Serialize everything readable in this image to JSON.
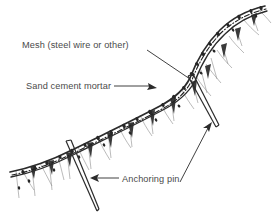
{
  "figure": {
    "background_color": "#ffffff",
    "line_color": "#2b2b2b",
    "hatch_color": "#8d8d8d",
    "text_color": "#4a4a4a",
    "mesh_line_style": "dash-dot"
  },
  "labels": [
    {
      "id": "mesh",
      "text": "Mesh (steel wire or other)",
      "x": 22,
      "y": 48,
      "leader": "line from label to slope band",
      "leader_arrow": false
    },
    {
      "id": "mortar",
      "text": "Sand cement mortar",
      "x": 26,
      "y": 89,
      "leader": "horizontal line with arrowhead into mortar band",
      "leader_arrow": true
    },
    {
      "id": "anchor",
      "text": "Anchoring pin",
      "x": 122,
      "y": 182,
      "leader": "horizontal line with arrowhead pointing left to pin",
      "leader_arrow": true
    }
  ],
  "components": {
    "mortar_band": "double line following the slope profile",
    "mesh_line": "dash-dot line running inside the mortar band",
    "stipple": "dark aggregate blobs inside the mortar band",
    "ground_hatch": "thin irregular hatch lines below the band representing soil",
    "anchoring_pins": [
      {
        "id": "pin-left",
        "from_x": 68,
        "from_y": 142,
        "to_x": 98,
        "to_y": 212
      },
      {
        "id": "pin-right",
        "from_x": 190,
        "from_y": 78,
        "to_x": 218,
        "to_y": 128
      }
    ]
  }
}
